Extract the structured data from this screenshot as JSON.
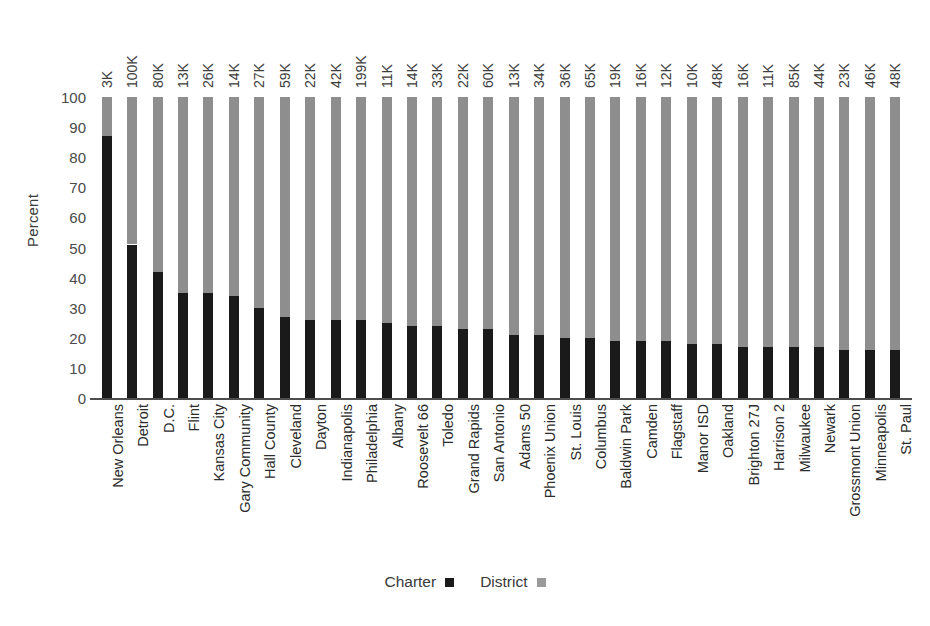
{
  "chart_data": {
    "type": "bar",
    "subtype": "stacked-100-percent",
    "title": "",
    "xlabel": "",
    "ylabel": "Percent",
    "ylim": [
      0,
      100
    ],
    "ytick_step": 10,
    "yticks": [
      "100",
      "90",
      "80",
      "70",
      "60",
      "50",
      "40",
      "30",
      "20",
      "10",
      "0"
    ],
    "grid": false,
    "legend_position": "bottom-center",
    "legend": [
      {
        "name": "Charter",
        "color": "#1a1a1a"
      },
      {
        "name": "District",
        "color": "#9a9a9a"
      }
    ],
    "categories": [
      "New Orleans",
      "Detroit",
      "D.C.",
      "Flint",
      "Kansas City",
      "Gary Community",
      "Hall County",
      "Cleveland",
      "Dayton",
      "Indianapolis",
      "Philadelphia",
      "Albany",
      "Roosevelt 66",
      "Toledo",
      "Grand Rapids",
      "San Antonio",
      "Adams 50",
      "Phoenix Union",
      "St. Louis",
      "Columbus",
      "Baldwin Park",
      "Camden",
      "Flagstaff",
      "Manor ISD",
      "Oakland",
      "Brighton 27J",
      "Harrison 2",
      "Milwaukee",
      "Newark",
      "Grossmont Union",
      "Minneapolis",
      "St. Paul"
    ],
    "top_labels": [
      "3K",
      "100K",
      "80K",
      "13K",
      "26K",
      "14K",
      "27K",
      "59K",
      "22K",
      "42K",
      "199K",
      "11K",
      "14K",
      "33K",
      "22K",
      "60K",
      "13K",
      "34K",
      "36K",
      "65K",
      "19K",
      "16K",
      "12K",
      "10K",
      "48K",
      "16K",
      "11K",
      "85K",
      "44K",
      "23K",
      "46K",
      "48K"
    ],
    "series": [
      {
        "name": "Charter",
        "color": "#1a1a1a",
        "values": [
          87,
          51,
          42,
          35,
          35,
          34,
          30,
          27,
          26,
          26,
          26,
          25,
          24,
          24,
          23,
          23,
          21,
          21,
          20,
          20,
          19,
          19,
          19,
          18,
          18,
          17,
          17,
          17,
          17,
          16,
          16,
          16
        ]
      },
      {
        "name": "District",
        "color": "#8e8e8e",
        "values": [
          13,
          49,
          58,
          65,
          65,
          66,
          70,
          73,
          74,
          74,
          74,
          75,
          76,
          76,
          77,
          77,
          79,
          79,
          80,
          80,
          81,
          81,
          81,
          82,
          82,
          83,
          83,
          83,
          83,
          84,
          84,
          84
        ]
      }
    ]
  },
  "axis": {
    "y_title": "Percent"
  }
}
